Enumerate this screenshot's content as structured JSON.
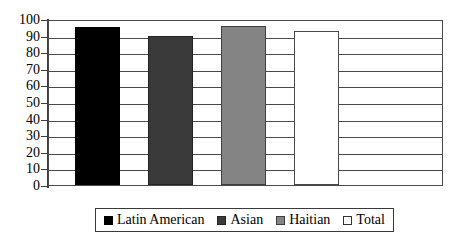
{
  "chart_data": {
    "type": "bar",
    "title": "",
    "xlabel": "",
    "ylabel": "",
    "ylim": [
      0,
      100
    ],
    "yticks": [
      100,
      90,
      80,
      70,
      60,
      50,
      40,
      30,
      20,
      10,
      0
    ],
    "grid": true,
    "legend_position": "bottom",
    "categories": [
      "Latin American",
      "Asian",
      "Haitian",
      "Total"
    ],
    "values": [
      95,
      90,
      96,
      93
    ],
    "series": [
      {
        "name": "Latin American",
        "value": 95,
        "color": "#000000"
      },
      {
        "name": "Asian",
        "value": 90,
        "color": "#3a3a3a"
      },
      {
        "name": "Haitian",
        "value": 96,
        "color": "#848484"
      },
      {
        "name": "Total",
        "value": 93,
        "color": "#ffffff"
      }
    ]
  },
  "axis": {
    "tick_labels": [
      "100",
      "90",
      "80",
      "70",
      "60",
      "50",
      "40",
      "30",
      "20",
      "10",
      "0"
    ]
  },
  "legend": {
    "entries": [
      {
        "label": "Latin American",
        "color": "#000000"
      },
      {
        "label": "Asian",
        "color": "#3a3a3a"
      },
      {
        "label": "Haitian",
        "color": "#848484"
      },
      {
        "label": "Total",
        "color": "#ffffff"
      }
    ]
  },
  "colors": {
    "axis": "#3f3f3f",
    "grid": "#4a4a4a",
    "background": "#ffffff",
    "text": "#000000"
  }
}
